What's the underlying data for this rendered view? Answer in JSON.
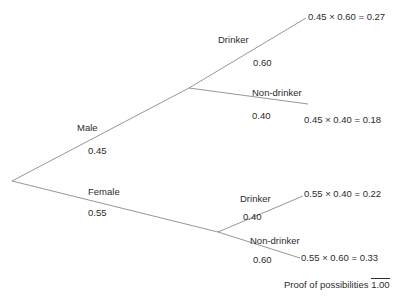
{
  "diagram": {
    "type": "probability-tree",
    "background_color": "#ffffff",
    "line_color": "#8a8a8a",
    "text_color": "#2b2b2b"
  },
  "nodes": {
    "root": {
      "x": 12,
      "y": 181
    },
    "male": {
      "x": 189,
      "y": 88
    },
    "female": {
      "x": 218,
      "y": 232
    }
  },
  "branches": {
    "male": {
      "label": "Male",
      "probability": "0.45",
      "label_x": 77,
      "label_y": 123,
      "prob_x": 88,
      "prob_y": 146
    },
    "female": {
      "label": "Female",
      "probability": "0.55",
      "label_x": 88,
      "label_y": 187,
      "prob_x": 88,
      "prob_y": 208
    },
    "male_drinker": {
      "label": "Drinker",
      "probability": "0.60",
      "label_x": 218,
      "label_y": 35,
      "prob_x": 253,
      "prob_y": 58
    },
    "male_nondrinker": {
      "label": "Non-drinker",
      "probability": "0.40",
      "label_x": 252,
      "label_y": 88,
      "prob_x": 252,
      "prob_y": 111
    },
    "female_drinker": {
      "label": "Drinker",
      "probability": "0.40",
      "label_x": 240,
      "label_y": 194,
      "prob_x": 243,
      "prob_y": 212
    },
    "female_nondrinker": {
      "label": "Non-drinker",
      "probability": "0.60",
      "label_x": 250,
      "label_y": 236,
      "prob_x": 253,
      "prob_y": 255
    }
  },
  "outcomes": [
    {
      "text": "0.45 × 0.60 = 0.27",
      "x": 308,
      "y": 12
    },
    {
      "text": "0.45 × 0.40 = 0.18",
      "x": 304,
      "y": 115
    },
    {
      "text": "0.55 × 0.40 = 0.22",
      "x": 304,
      "y": 189
    },
    {
      "text": "0.55 × 0.60 = 0.33",
      "x": 301,
      "y": 253
    }
  ],
  "total": {
    "label": "Proof of possibilities",
    "value": "1.00",
    "x": 284,
    "y": 278
  }
}
